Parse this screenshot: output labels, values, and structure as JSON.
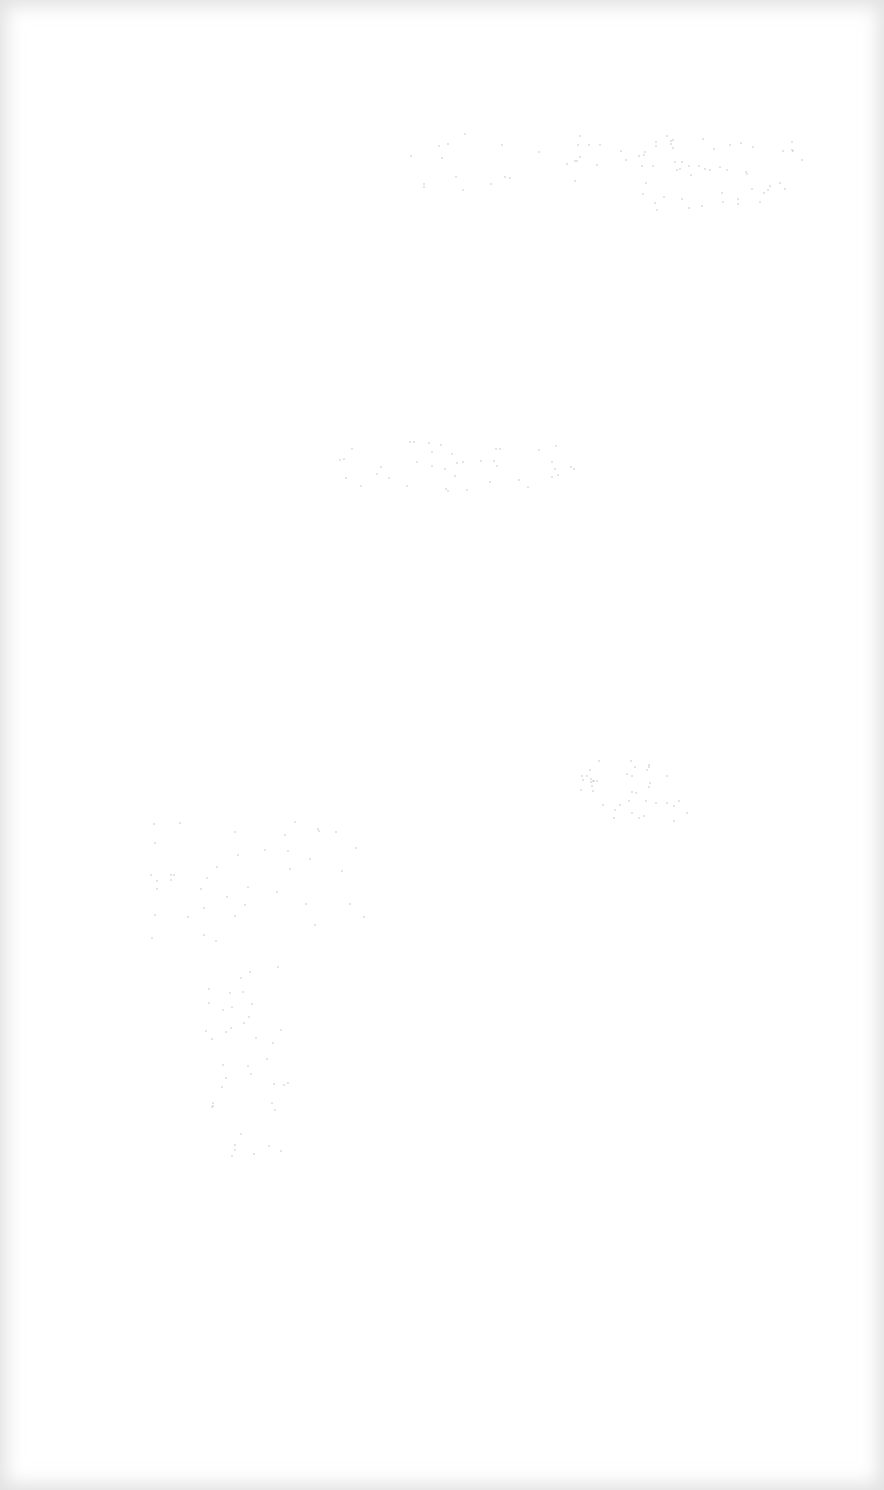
{
  "page": {
    "description": "Blank, washed-out white page with faint noise and gray edge vignette; no legible content",
    "background_color": "#ffffff",
    "vignette_color": "#c8c8c8"
  }
}
